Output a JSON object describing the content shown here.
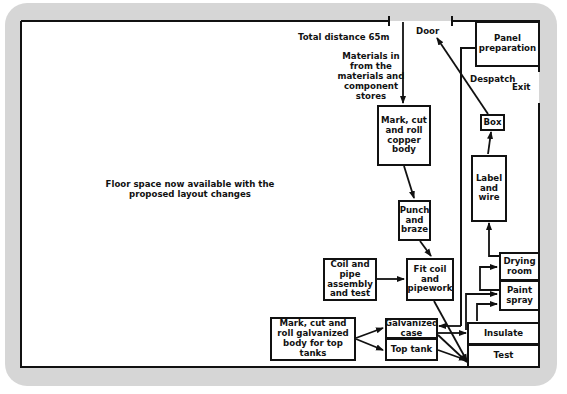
{
  "diagram": {
    "accent_color": "#111111",
    "frame_color": "#d6d6d6",
    "labels": {
      "total_distance": "Total distance 65m",
      "door": "Door",
      "materials_in": "Materials in\nfrom the\nmaterials and\ncomponent\nstores",
      "despatch": "Despatch",
      "exit": "Exit",
      "floor_space": "Floor space now available with the\nproposed layout changes"
    },
    "boxes": {
      "panel_preparation": "Panel\npreparation",
      "mark_cut_copper": "Mark, cut\nand roll\ncopper\nbody",
      "punch_braze": "Punch\nand\nbraze",
      "coil_pipe": "Coil and\npipe\nassembly\nand test",
      "fit_coil": "Fit coil\nand\npipework",
      "mark_cut_galvanized": "Mark, cut and\nroll galvanized\nbody for top\ntanks",
      "galvanized_case": "Galvanized\ncase",
      "top_tank": "Top tank",
      "box": "Box",
      "label_wire": "Label\nand\nwire",
      "drying_room": "Drying\nroom",
      "paint_spray": "Paint\nspray",
      "insulate": "Insulate",
      "test": "Test"
    },
    "flow": [
      "Materials in -> Mark, cut and roll copper body",
      "Mark, cut and roll copper body -> Punch and braze",
      "Punch and braze -> Fit coil and pipework",
      "Coil and pipe assembly and test -> Fit coil and pipework",
      "Fit coil and pipework -> Test",
      "Mark, cut and roll galvanized body for top tanks -> Galvanized case",
      "Mark, cut and roll galvanized body for top tanks -> Top tank",
      "Galvanized case -> Test",
      "Top tank -> Test",
      "Galvanized case -> Insulate",
      "Insulate -> Paint spray",
      "Paint spray -> Drying room",
      "Drying room -> Label and wire",
      "Label and wire -> Box",
      "Box -> Door"
    ]
  }
}
